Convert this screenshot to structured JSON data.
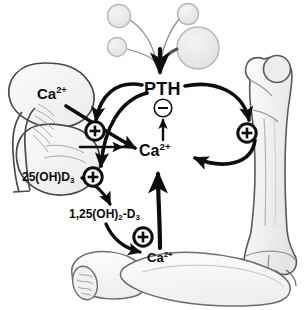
{
  "figure": {
    "background_color": "#ffffff",
    "ink_color": "#0d0d0d",
    "organ_fill": "#f2f2f2",
    "organ_stroke": "#6e6e6e",
    "width": 306,
    "height": 310
  },
  "labels": {
    "pth": "PTH",
    "calcium_center": "Ca",
    "calcium_center_charge": "2+",
    "calcium_kidney": "Ca",
    "calcium_kidney_charge": "2+",
    "calcium_gut": "Ca",
    "calcium_gut_charge": "2+",
    "vitd_25": "25(OH)D",
    "vitd_25_sub": "3",
    "vitd_125_pre": "1,25(OH)",
    "vitd_125_sub": "2",
    "vitd_125_post": "-D",
    "vitd_125_sub2": "3"
  },
  "signs": {
    "minus": "−",
    "plus": "+",
    "minus_name": "inhibition",
    "plus_name": "stimulation"
  },
  "organs": [
    {
      "name": "parathyroid-glands",
      "label": "parathyroid glands",
      "count": 4
    },
    {
      "name": "kidney",
      "label": "kidney"
    },
    {
      "name": "femur-bone",
      "label": "bone"
    },
    {
      "name": "intestine",
      "label": "intestine"
    }
  ],
  "nodes": [
    {
      "id": "pth",
      "label": "PTH",
      "x": 163,
      "y": 88
    },
    {
      "id": "calcium-serum",
      "label": "Ca2+",
      "x": 157,
      "y": 153
    },
    {
      "id": "calcium-kidney",
      "label": "Ca2+",
      "x": 54,
      "y": 94
    },
    {
      "id": "calcium-gut",
      "label": "Ca2+",
      "x": 161,
      "y": 258
    },
    {
      "id": "vitd-25",
      "label": "25(OH)D3",
      "x": 52,
      "y": 178
    },
    {
      "id": "vitd-125",
      "label": "1,25(OH)2-D3",
      "x": 104,
      "y": 215
    }
  ],
  "sign_markers": [
    {
      "id": "minus-pth",
      "sign": "minus",
      "x": 163,
      "y": 108,
      "r": 9,
      "target": "pth"
    },
    {
      "id": "plus-kidney-upper",
      "sign": "plus",
      "x": 95,
      "y": 131,
      "r": 9,
      "target": "kidney-calcium-reabsorption"
    },
    {
      "id": "plus-kidney-lower",
      "sign": "plus",
      "x": 93,
      "y": 177,
      "r": 9,
      "target": "kidney-hydroxylation"
    },
    {
      "id": "plus-bone",
      "sign": "plus",
      "x": 247,
      "y": 133,
      "r": 9,
      "target": "bone-resorption"
    },
    {
      "id": "plus-intestine",
      "sign": "plus",
      "x": 143,
      "y": 237,
      "r": 9,
      "target": "intestinal-absorption"
    }
  ]
}
